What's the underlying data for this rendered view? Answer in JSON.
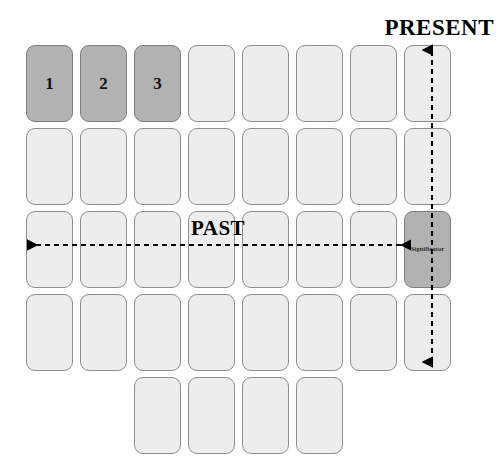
{
  "diagram": {
    "title_present": "PRESENT",
    "title_past": "PAST",
    "significator_label": "Significator",
    "colors": {
      "background": "#ffffff",
      "card_fill": "#ededed",
      "card_fill_shaded": "#b2b2b2",
      "card_border": "#8e8e8e",
      "text": "#000000",
      "arrow": "#000000"
    },
    "grid": {
      "columns": 8,
      "rows": 5,
      "card_width": 47,
      "card_height": 77,
      "column_pitch": 54,
      "row_pitch": 83,
      "origin_x": 26,
      "origin_y": 45
    },
    "numbered_cards": [
      {
        "number": "1",
        "row": 0,
        "col": 0
      },
      {
        "number": "2",
        "row": 0,
        "col": 1
      },
      {
        "number": "3",
        "row": 0,
        "col": 2
      }
    ],
    "rows": [
      {
        "index": 0,
        "start_col": 0,
        "count": 8
      },
      {
        "index": 1,
        "start_col": 0,
        "count": 8
      },
      {
        "index": 2,
        "start_col": 0,
        "count": 8
      },
      {
        "index": 3,
        "start_col": 0,
        "count": 8
      },
      {
        "index": 4,
        "start_col": 2,
        "count": 4
      }
    ],
    "arrows": [
      {
        "name": "present-axis",
        "orientation": "vertical",
        "style": "dashed",
        "heads": "both",
        "from": {
          "x": 432,
          "y": 362
        },
        "to": {
          "x": 432,
          "y": 50
        }
      },
      {
        "name": "past-axis",
        "orientation": "horizontal",
        "style": "dashed",
        "heads": "both",
        "from": {
          "x": 401,
          "y": 245
        },
        "to": {
          "x": 28,
          "y": 245
        }
      }
    ]
  }
}
